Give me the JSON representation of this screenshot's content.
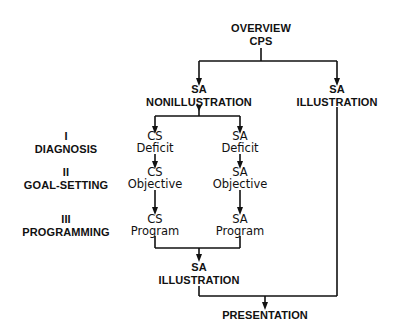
{
  "diagram": {
    "type": "flowchart",
    "nodes": {
      "overview": {
        "line1": "OVERVIEW",
        "line2": "CPS"
      },
      "sa_nonillustration": {
        "line1": "SA",
        "line2": "NONILLUSTRATION"
      },
      "sa_illustration_top": {
        "line1": "SA",
        "line2": "ILLUSTRATION"
      },
      "cs_deficit": {
        "line1": "CS",
        "line2": "Deficit"
      },
      "sa_deficit": {
        "line1": "SA",
        "line2": "Deficit"
      },
      "cs_objective": {
        "line1": "CS",
        "line2": "Objective"
      },
      "sa_objective": {
        "line1": "SA",
        "line2": "Objective"
      },
      "cs_program": {
        "line1": "CS",
        "line2": "Program"
      },
      "sa_program": {
        "line1": "SA",
        "line2": "Program"
      },
      "sa_illustration_bottom": {
        "line1": "SA",
        "line2": "ILLUSTRATION"
      },
      "presentation": {
        "line1": "PRESENTATION"
      }
    },
    "phases": [
      {
        "numeral": "I",
        "name": "DIAGNOSIS"
      },
      {
        "numeral": "II",
        "name": "GOAL-SETTING"
      },
      {
        "numeral": "III",
        "name": "PROGRAMMING"
      }
    ],
    "edges": [
      [
        "overview",
        "sa_nonillustration"
      ],
      [
        "overview",
        "sa_illustration_top"
      ],
      [
        "sa_nonillustration",
        "cs_deficit"
      ],
      [
        "sa_nonillustration",
        "sa_deficit"
      ],
      [
        "cs_deficit",
        "cs_objective"
      ],
      [
        "sa_deficit",
        "sa_objective"
      ],
      [
        "cs_objective",
        "cs_program"
      ],
      [
        "sa_objective",
        "sa_program"
      ],
      [
        "cs_program",
        "sa_illustration_bottom"
      ],
      [
        "sa_program",
        "sa_illustration_bottom"
      ],
      [
        "sa_illustration_bottom",
        "presentation"
      ],
      [
        "sa_illustration_top",
        "presentation"
      ]
    ],
    "colors": {
      "line": "#111111",
      "text": "#111111",
      "background": "#ffffff"
    }
  }
}
